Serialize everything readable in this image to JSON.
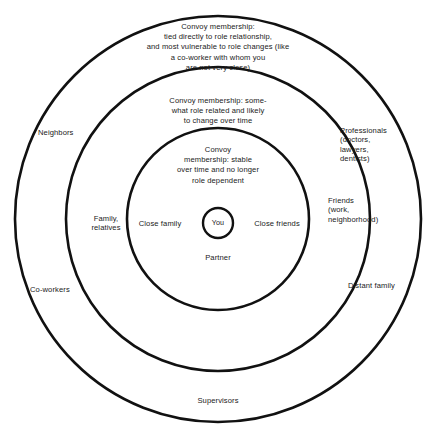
{
  "diagram": {
    "stroke_color": "#111111",
    "background_color": "#ffffff",
    "text_color": "#1a1a1a",
    "center": {
      "label": "You"
    },
    "rings": [
      {
        "name": "inner-ring",
        "description": "Convoy\nmembership: stable\nover time and no longer\nrole dependent",
        "members": [
          "Close family",
          "Close friends",
          "Partner"
        ]
      },
      {
        "name": "middle-ring",
        "description": "Convoy membership: some-\nwhat role related and likely\nto change over time",
        "members": [
          "Family,\nrelatives",
          "Friends\n(work,\nneighborhood)"
        ]
      },
      {
        "name": "outer-ring",
        "description": "Convoy membership:\ntied directly to role relationship,\nand most vulnerable to role changes (like\na co-worker with whom you\nare not very close)",
        "members": [
          "Neighbors",
          "Co-workers",
          "Professionals\n(doctors,\nlawyers,\ndentists)",
          "Distant family",
          "Supervisors"
        ]
      }
    ],
    "labels": {
      "ring1_text": "Convoy membership:\ntied directly to role relationship,\nand most vulnerable to role changes (like\na co-worker with whom you\nare not very close)",
      "ring2_text": "Convoy membership: some-\nwhat role related and likely\nto change over time",
      "ring3_text": "Convoy\nmembership: stable\nover time and no longer\nrole dependent",
      "neighbors": "Neighbors",
      "co_workers": "Co-workers",
      "professionals": "Professionals\n(doctors,\nlawyers,\ndentists)",
      "friends": "Friends\n(work,\nneighborhood)",
      "distant_family": "Distant family",
      "supervisors": "Supervisors",
      "family_relatives": "Family,\nrelatives",
      "close_family": "Close family",
      "close_friends": "Close friends",
      "partner": "Partner",
      "you": "You"
    },
    "geometry": {
      "center_x": 218,
      "center_y": 219,
      "r_outer": 203,
      "r_middle": 152,
      "r_inner": 91,
      "r_core": 15
    }
  }
}
